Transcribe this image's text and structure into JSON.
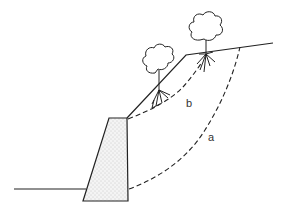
{
  "figure": {
    "colors": {
      "line": "#222222",
      "wall_fill": "#f4f4f4",
      "dots": "#9a9a9a",
      "background": "#ffffff"
    },
    "labels": {
      "a": "a",
      "b": "b"
    },
    "elements": [
      {
        "name": "ground-line",
        "type": "line"
      },
      {
        "name": "retaining-wall",
        "type": "trapezoid",
        "fill": "dotted"
      },
      {
        "name": "slope-surface",
        "type": "polyline"
      },
      {
        "name": "slip-surface-a",
        "type": "dashed-curve",
        "label": "a"
      },
      {
        "name": "slip-surface-b",
        "type": "dashed-curve",
        "label": "b"
      },
      {
        "name": "tree-lower",
        "type": "tree-with-roots"
      },
      {
        "name": "tree-upper",
        "type": "tree-with-roots"
      }
    ]
  }
}
